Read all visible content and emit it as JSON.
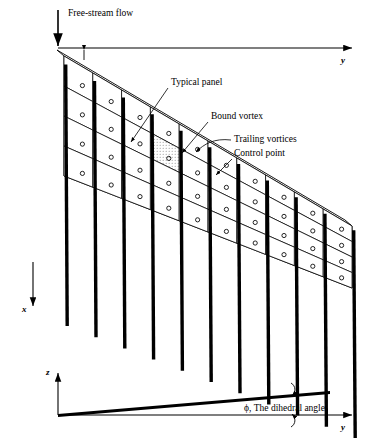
{
  "figure": {
    "labels": {
      "freestream": "Free-stream flow",
      "typical_panel": "Typical panel",
      "bound_vortex": "Bound vortex",
      "trailing_vortices": "Trailing vortices",
      "control_point": "Control point",
      "dihedral": "ϕ, The dihedral angle",
      "sweep_symbol": "Λ",
      "sweep_subscript": "LE"
    },
    "axes": {
      "y_top": "y",
      "x_down": "x",
      "z_up": "z",
      "y_bottom": "y"
    },
    "colors": {
      "ink": "#000000",
      "panel_fill": "#ffffff",
      "vortex_fill": "#000000",
      "highlight_fill": "#d9d9d9"
    },
    "geometry": {
      "spanwise_panels": 10,
      "chordwise_panels": 4,
      "origin_x": 58,
      "origin_y": 48,
      "root_chord": 120,
      "tip_chord": 62,
      "semi_span": 288,
      "leading_edge_drop": 170,
      "trailing_streamer_length": 150
    },
    "dihedral_view": {
      "origin_x": 58,
      "origin_y": 415,
      "axis_length": 300,
      "wing_rise": 22,
      "z_axis_height": 42
    }
  }
}
